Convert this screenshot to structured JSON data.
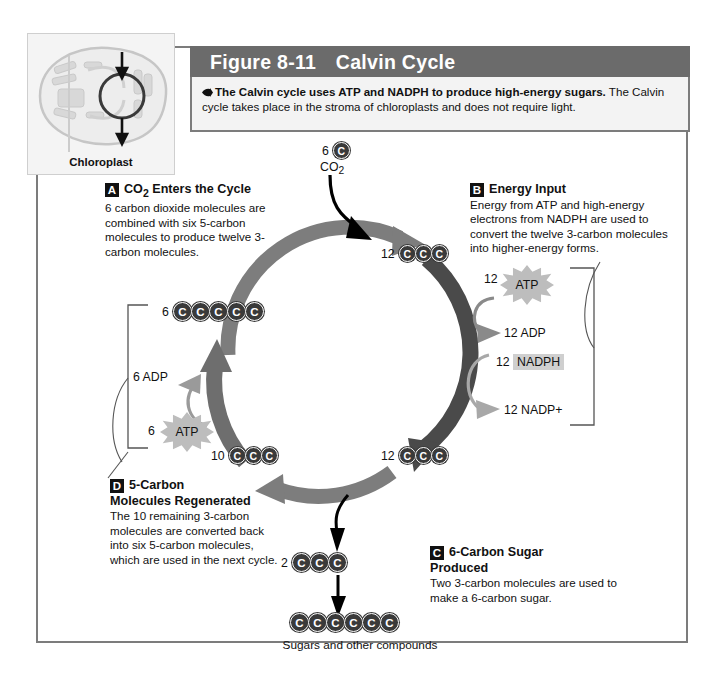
{
  "figure": {
    "number": "Figure 8-11",
    "title": "Calvin Cycle",
    "caption_bold": "The Calvin cycle uses ATP and NADPH to produce high-energy sugars.",
    "caption_rest": " The Calvin cycle takes place in the stroma of chloroplasts and does not require light."
  },
  "inset": {
    "label": "Chloroplast"
  },
  "sections": {
    "a": {
      "letter": "A",
      "heading_pre": "CO",
      "heading_sub": "2",
      "heading_post": " Enters the Cycle",
      "body": "6 carbon dioxide molecules are combined with six 5-carbon molecules to produce twelve 3-carbon molecules."
    },
    "b": {
      "letter": "B",
      "heading": "Energy Input",
      "body": "Energy from ATP and high-energy electrons from NADPH are used to convert the twelve 3-carbon molecules into higher-energy forms."
    },
    "c": {
      "letter": "C",
      "heading_line1": "6-Carbon Sugar",
      "heading_line2": "Produced",
      "body": "Two 3-carbon molecules are used to make a 6-carbon sugar."
    },
    "d": {
      "letter": "D",
      "heading_line1": "5-Carbon",
      "heading_line2": "Molecules Regenerated",
      "body": "The 10 remaining 3-carbon molecules are converted back into six 5-carbon molecules, which are used in the next cycle."
    }
  },
  "molecules": {
    "co2_count": "6",
    "co2_label": "CO",
    "co2_sub": "2",
    "top_right_count": "12",
    "bottom_right_count": "12",
    "bottom_left_count": "10",
    "left_five_carbon_count": "6",
    "sugar_out_count": "2",
    "carbon_letter": "C"
  },
  "energy_right": {
    "atp": {
      "count": "12",
      "label": "ATP"
    },
    "adp": {
      "count": "12",
      "label": "ADP"
    },
    "nadph": {
      "count": "12",
      "label": "NADPH"
    },
    "nadp_plus": {
      "count": "12",
      "label": "NADP+"
    }
  },
  "energy_left": {
    "adp": {
      "count": "6",
      "label": "ADP"
    },
    "atp": {
      "count": "6",
      "label": "ATP"
    }
  },
  "output": {
    "caption": "Sugars and other compounds"
  },
  "colors": {
    "header_band": "#6b6b6b",
    "caption_bg": "#f3f3f3",
    "frame_border": "#7c7c7c",
    "cycle_arc_light": "#7d7d7d",
    "cycle_arc_dark": "#4a4a4a",
    "carbon_circle": "#3a3a3a",
    "starburst": "#bdbdbd",
    "highlight": "#cfcfcf"
  }
}
